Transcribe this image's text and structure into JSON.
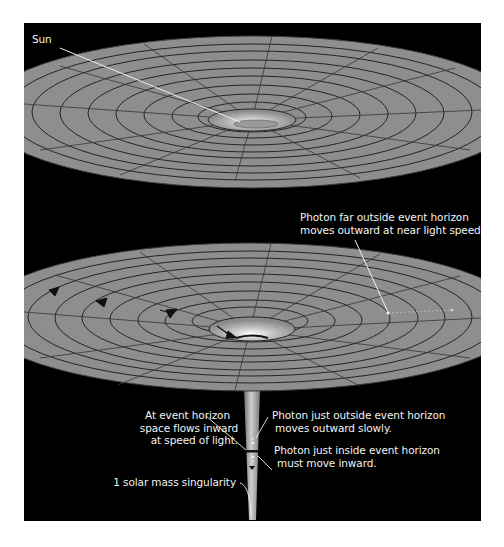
{
  "figure": {
    "background": "#000000",
    "surface_color": "#8c8c8c",
    "grid_color": "#2a2a2a",
    "pointer_color": "#f0f0f0",
    "panels": [
      {
        "id": "sun-spacetime",
        "labels": {
          "sun": "Sun"
        }
      },
      {
        "id": "black-hole-spacetime",
        "labels": {
          "photon_far": [
            "Photon far outside event horizon",
            "moves outward at near light speed."
          ],
          "event_horizon": [
            "At event horizon",
            "space flows inward",
            "at speed of light."
          ],
          "photon_outside": [
            "Photon just outside event horizon",
            "moves outward slowly."
          ],
          "photon_inside": [
            "Photon just inside event horizon",
            "must move inward."
          ],
          "singularity": "1 solar mass singularity"
        }
      }
    ]
  }
}
